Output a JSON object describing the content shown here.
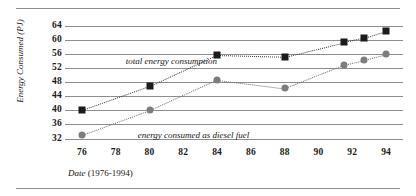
{
  "figure": {
    "rule_color": "#8c8c8c",
    "background": "#ffffff"
  },
  "axis": {
    "ylabel_prefix": "Energy Consumed",
    "ylabel_units": "(PJ)",
    "xlabel_prefix": "Date",
    "xlabel_range": "(1976-1994)"
  },
  "annotations": {
    "total": "total energy consumption",
    "diesel": "energy consumed as diesel fuel"
  },
  "chart_data": {
    "type": "line",
    "title": "",
    "xlabel": "Date (1976-1994)",
    "ylabel": "Energy Consumed (PJ)",
    "xlim": [
      75,
      95
    ],
    "ylim": [
      31,
      65
    ],
    "xticks": [
      76,
      78,
      80,
      82,
      84,
      86,
      88,
      90,
      92,
      94
    ],
    "yticks": [
      32,
      36,
      40,
      44,
      48,
      52,
      56,
      60,
      64
    ],
    "xtick_labels": [
      "76",
      "78",
      "80",
      "82",
      "84",
      "86",
      "88",
      "90",
      "92",
      "94"
    ],
    "ytick_labels": [
      "32",
      "36",
      "40",
      "44",
      "48",
      "52",
      "56",
      "60",
      "64"
    ],
    "grid": "horizontal",
    "legend": "inline-annotations",
    "series": [
      {
        "name": "total energy consumption",
        "marker": "square",
        "color": "#1b1b1b",
        "linestyle": "dotted",
        "x": [
          76,
          80,
          84,
          88,
          91.5,
          92.7,
          94
        ],
        "values": [
          40.0,
          46.8,
          55.7,
          55.2,
          59.3,
          60.6,
          62.5
        ]
      },
      {
        "name": "energy consumed as diesel fuel",
        "marker": "circle",
        "color": "#7d7d7d",
        "linestyle": "dotted",
        "x": [
          76,
          80,
          84,
          88,
          91.5,
          92.7,
          94
        ],
        "values": [
          33.0,
          40.0,
          48.7,
          46.3,
          52.9,
          54.3,
          55.9
        ]
      }
    ]
  }
}
